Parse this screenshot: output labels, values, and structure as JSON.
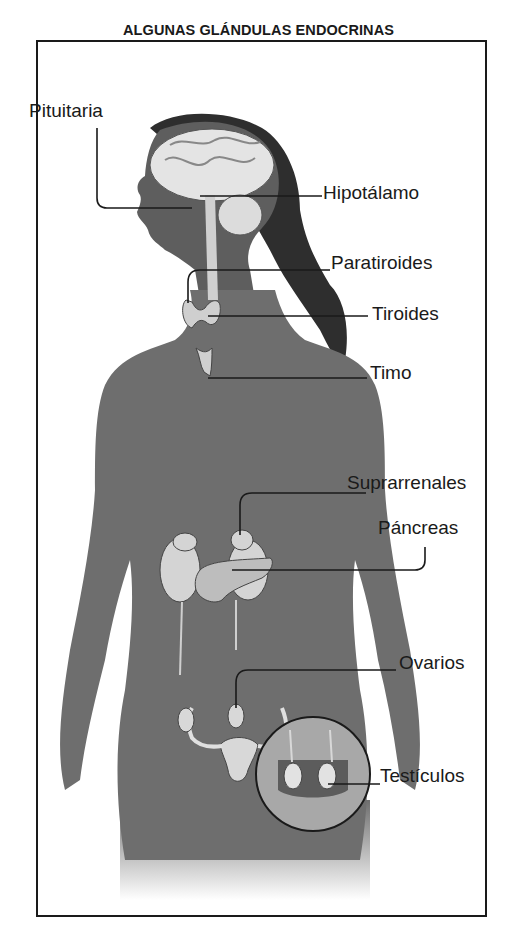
{
  "figure": {
    "title": "ALGUNAS GLÁNDULAS ENDOCRINAS",
    "colors": {
      "frame": "#1a1a1a",
      "body": "#6e6e6e",
      "hair": "#2e2e2e",
      "organ": "#d9d9d9",
      "background": "#ffffff"
    },
    "labels": {
      "pituitaria": "Pituitaria",
      "hipotalamo": "Hipotálamo",
      "paratiroides": "Paratiroides",
      "tiroides": "Tiroides",
      "timo": "Timo",
      "suprarrenales": "Suprarrenales",
      "pancreas": "Páncreas",
      "ovarios": "Ovarios",
      "testiculos": "Testículos"
    }
  }
}
